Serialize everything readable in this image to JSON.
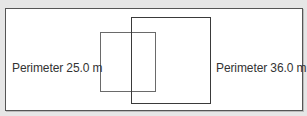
{
  "diagram": {
    "shapes": [
      {
        "id": "small-square",
        "label": "Perimeter 25.0  m",
        "perimeter": 25.0,
        "unit": "m"
      },
      {
        "id": "large-square",
        "label": "Perimeter 36.0  m",
        "perimeter": 36.0,
        "unit": "m"
      }
    ],
    "colors": {
      "background": "#e6e6e6",
      "frame": "#ffffff",
      "stroke": "#444444",
      "text": "#333333"
    }
  }
}
